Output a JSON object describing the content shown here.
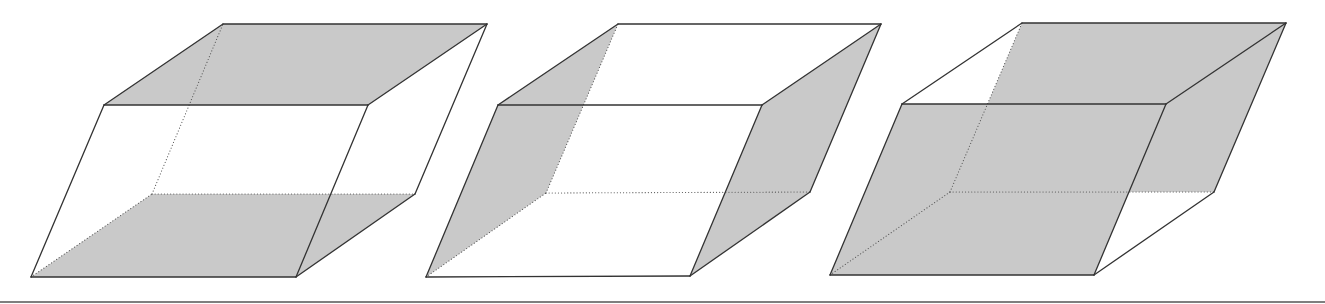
{
  "diagram": {
    "title": "",
    "colors": {
      "background": "#ffffff",
      "shade": "#c9c9c9",
      "edge": "#333333",
      "hidden_edge": "#555555",
      "divider": "#555555"
    },
    "divider": {
      "y": 302,
      "x1": 0,
      "x2": 1325
    },
    "figures": [
      {
        "id": "parallelepiped-1",
        "description": "Top and bottom faces shaded",
        "vertices": {
          "FBL": [
            31,
            277
          ],
          "FBR": [
            296,
            277
          ],
          "FTR": [
            368,
            105
          ],
          "FTL": [
            104,
            105
          ],
          "BBL": [
            152,
            194
          ],
          "BBR": [
            415,
            194
          ],
          "BTR": [
            487,
            24
          ],
          "BTL": [
            223,
            24
          ]
        },
        "shaded_faces": [
          {
            "name": "top-face",
            "points": [
              "FTL",
              "FTR",
              "BTR",
              "BTL"
            ]
          },
          {
            "name": "bottom-face",
            "points": [
              "FBL",
              "FBR",
              "BBR",
              "BBL"
            ]
          }
        ],
        "visible_edges": [
          [
            "FBL",
            "FBR"
          ],
          [
            "FBR",
            "FTR"
          ],
          [
            "FTR",
            "FTL"
          ],
          [
            "FTL",
            "FBL"
          ],
          [
            "FTL",
            "BTL"
          ],
          [
            "BTL",
            "BTR"
          ],
          [
            "BTR",
            "FTR"
          ],
          [
            "BTR",
            "BBR"
          ],
          [
            "BBR",
            "FBR"
          ]
        ],
        "hidden_edges": [
          [
            "FBL",
            "BBL"
          ],
          [
            "BBL",
            "BBR"
          ],
          [
            "BBL",
            "BTL"
          ]
        ]
      },
      {
        "id": "parallelepiped-2",
        "description": "Left and right side faces shaded",
        "vertices": {
          "FBL": [
            426,
            277
          ],
          "FBR": [
            690,
            276
          ],
          "FTR": [
            762,
            105
          ],
          "FTL": [
            498,
            105
          ],
          "BBL": [
            546,
            193
          ],
          "BBR": [
            810,
            192
          ],
          "BTR": [
            881,
            24
          ],
          "BTL": [
            618,
            24
          ]
        },
        "shaded_faces": [
          {
            "name": "left-face",
            "points": [
              "FTL",
              "BTL",
              "BBL",
              "FBL"
            ]
          },
          {
            "name": "right-face",
            "points": [
              "FTR",
              "BTR",
              "BBR",
              "FBR"
            ]
          }
        ],
        "visible_edges": [
          [
            "FBL",
            "FBR"
          ],
          [
            "FBR",
            "FTR"
          ],
          [
            "FTR",
            "FTL"
          ],
          [
            "FTL",
            "FBL"
          ],
          [
            "FTL",
            "BTL"
          ],
          [
            "BTL",
            "BTR"
          ],
          [
            "BTR",
            "FTR"
          ],
          [
            "BTR",
            "BBR"
          ],
          [
            "BBR",
            "FBR"
          ]
        ],
        "hidden_edges": [
          [
            "FBL",
            "BBL"
          ],
          [
            "BBL",
            "BBR"
          ],
          [
            "BBL",
            "BTL"
          ]
        ]
      },
      {
        "id": "parallelepiped-3",
        "description": "Front and back faces shaded",
        "vertices": {
          "FBL": [
            830,
            275
          ],
          "FBR": [
            1094,
            275
          ],
          "FTR": [
            1166,
            104
          ],
          "FTL": [
            902,
            104
          ],
          "BBL": [
            950,
            192
          ],
          "BBR": [
            1214,
            192
          ],
          "BTR": [
            1286,
            23
          ],
          "BTL": [
            1022,
            23
          ]
        },
        "shaded_faces": [
          {
            "name": "back-face",
            "points": [
              "BBL",
              "BBR",
              "BTR",
              "BTL"
            ]
          },
          {
            "name": "front-face",
            "points": [
              "FBL",
              "FBR",
              "FTR",
              "FTL"
            ]
          }
        ],
        "visible_edges": [
          [
            "FBL",
            "FBR"
          ],
          [
            "FBR",
            "FTR"
          ],
          [
            "FTR",
            "FTL"
          ],
          [
            "FTL",
            "FBL"
          ],
          [
            "FTL",
            "BTL"
          ],
          [
            "BTL",
            "BTR"
          ],
          [
            "BTR",
            "FTR"
          ],
          [
            "BTR",
            "BBR"
          ],
          [
            "BBR",
            "FBR"
          ]
        ],
        "hidden_edges": [
          [
            "FBL",
            "BBL"
          ],
          [
            "BBL",
            "BBR"
          ],
          [
            "BBL",
            "BTL"
          ]
        ]
      }
    ]
  }
}
